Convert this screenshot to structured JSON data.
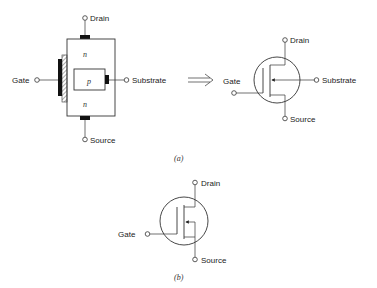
{
  "figure_a": {
    "caption": "(a)",
    "cross_section": {
      "terminals": {
        "drain": "Drain",
        "gate": "Gate",
        "substrate": "Substrate",
        "source": "Source"
      },
      "regions": {
        "top": "n",
        "middle": "p",
        "bottom": "n"
      }
    },
    "arrow": "implies-arrow",
    "symbol": {
      "terminals": {
        "drain": "Drain",
        "gate": "Gate",
        "substrate": "Substrate",
        "source": "Source"
      }
    }
  },
  "figure_b": {
    "caption": "(b)",
    "symbol": {
      "terminals": {
        "drain": "Drain",
        "gate": "Gate",
        "source": "Source"
      }
    }
  },
  "colors": {
    "line": "#333333",
    "metal": "#111111",
    "background": "#ffffff"
  }
}
